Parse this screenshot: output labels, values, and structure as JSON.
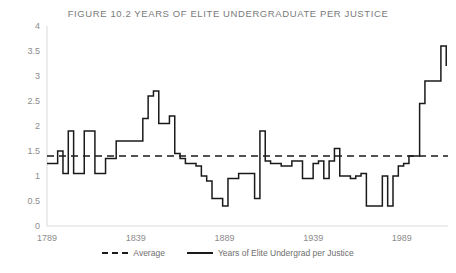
{
  "chart_data": {
    "type": "line",
    "title": "FIGURE 10.2  YEARS OF ELITE UNDERGRADUATE PER JUSTICE",
    "xlabel": "",
    "ylabel": "",
    "xlim": [
      1789,
      2015
    ],
    "ylim": [
      0,
      4
    ],
    "ytick_labels": [
      "0",
      "0.5",
      "1",
      "1.5",
      "2",
      "2.5",
      "3",
      "3.5",
      "4"
    ],
    "ytick_values": [
      0,
      0.5,
      1,
      1.5,
      2,
      2.5,
      3,
      3.5,
      4
    ],
    "xtick_labels": [
      "1789",
      "1839",
      "1889",
      "1939",
      "1989"
    ],
    "xtick_values": [
      1789,
      1839,
      1889,
      1939,
      1989
    ],
    "grid": false,
    "legend_position": "bottom",
    "average_value": 1.4,
    "series": [
      {
        "name": "Average",
        "style": "dashed",
        "color": "#1a1a1a",
        "constant": 1.4
      },
      {
        "name": "Years of Elite Undergrad per Justice",
        "style": "solid",
        "color": "#1a1a1a",
        "x": [
          1789,
          1792,
          1795,
          1798,
          1801,
          1804,
          1807,
          1810,
          1813,
          1816,
          1819,
          1822,
          1825,
          1828,
          1831,
          1834,
          1837,
          1840,
          1843,
          1846,
          1849,
          1852,
          1855,
          1858,
          1861,
          1864,
          1867,
          1870,
          1873,
          1876,
          1879,
          1882,
          1885,
          1888,
          1891,
          1894,
          1897,
          1900,
          1903,
          1906,
          1909,
          1912,
          1915,
          1918,
          1921,
          1924,
          1927,
          1930,
          1933,
          1936,
          1939,
          1942,
          1945,
          1948,
          1951,
          1954,
          1957,
          1960,
          1963,
          1966,
          1969,
          1972,
          1975,
          1978,
          1981,
          1984,
          1987,
          1990,
          1993,
          1996,
          1999,
          2002,
          2005,
          2008,
          2011,
          2014
        ],
        "values": [
          1.25,
          1.25,
          1.5,
          1.05,
          1.9,
          1.05,
          1.05,
          1.9,
          1.9,
          1.05,
          1.05,
          1.35,
          1.35,
          1.7,
          1.7,
          1.7,
          1.7,
          1.7,
          2.15,
          2.6,
          2.7,
          2.05,
          2.05,
          2.2,
          1.45,
          1.35,
          1.25,
          1.25,
          1.2,
          1.0,
          0.9,
          0.55,
          0.55,
          0.4,
          0.95,
          0.95,
          1.05,
          1.05,
          1.05,
          0.55,
          1.9,
          1.3,
          1.25,
          1.25,
          1.2,
          1.2,
          1.3,
          1.3,
          0.95,
          0.95,
          1.25,
          1.3,
          0.95,
          1.3,
          1.55,
          1.0,
          1.0,
          0.95,
          1.0,
          1.05,
          0.4,
          0.4,
          0.4,
          1.0,
          0.4,
          1.0,
          1.2,
          1.25,
          1.4,
          1.4,
          2.45,
          2.9,
          2.9,
          2.9,
          3.6,
          3.2
        ]
      }
    ]
  },
  "legend": {
    "entries": [
      {
        "label": "Average",
        "style": "dashed"
      },
      {
        "label": "Years of Elite Undergrad per Justice",
        "style": "solid"
      }
    ]
  }
}
